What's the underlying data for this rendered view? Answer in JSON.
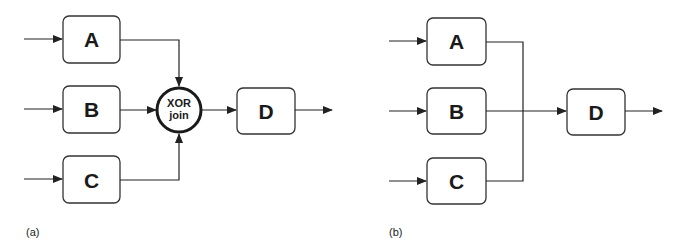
{
  "panel_a": {
    "caption": "(a)",
    "inputs": [
      {
        "label": "A"
      },
      {
        "label": "B"
      },
      {
        "label": "C"
      }
    ],
    "join": {
      "line1": "XOR",
      "line2": "join"
    },
    "output": {
      "label": "D"
    }
  },
  "panel_b": {
    "caption": "(b)",
    "inputs": [
      {
        "label": "A"
      },
      {
        "label": "B"
      },
      {
        "label": "C"
      }
    ],
    "output": {
      "label": "D"
    }
  }
}
